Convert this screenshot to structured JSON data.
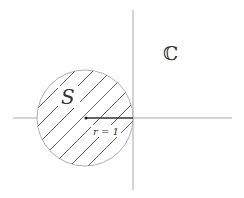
{
  "diagram": {
    "type": "complex-plane-disk",
    "labels": {
      "set_name": "S",
      "plane_name": "ℂ",
      "radius_label": "r = 1"
    },
    "geometry": {
      "horizontal_axis": {
        "x1": 13,
        "x2": 232,
        "y": 118
      },
      "vertical_axis": {
        "x": 133,
        "y1": 10,
        "y2": 190
      },
      "disk": {
        "cx": 85,
        "cy": 118,
        "r": 48,
        "hatching": "diagonal"
      },
      "radius_segment": {
        "x1": 86,
        "y1": 118,
        "x2": 133,
        "y2": 118
      }
    },
    "colors": {
      "background": "#ffffff",
      "axis": "#a8a8a8",
      "hatch": "#555555",
      "text": "#333333"
    }
  }
}
